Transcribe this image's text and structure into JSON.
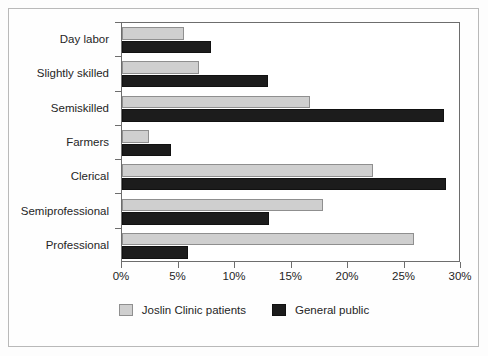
{
  "chart_data": {
    "type": "bar",
    "orientation": "horizontal",
    "title": "",
    "subtitle": "",
    "xlabel": "",
    "ylabel": "",
    "xlim": [
      0,
      30
    ],
    "ylim": null,
    "grid": false,
    "legend_position": "bottom-center",
    "xticks": [
      0,
      5,
      10,
      15,
      20,
      25,
      30
    ],
    "xtick_labels": [
      "0%",
      "5%",
      "10%",
      "15%",
      "20%",
      "25%",
      "30%"
    ],
    "categories": [
      "Day labor",
      "Slightly skilled",
      "Semiskilled",
      "Farmers",
      "Clerical",
      "Semiprofessional",
      "Professional"
    ],
    "series": [
      {
        "name": "Joslin Clinic patients",
        "color": "#cfcfcf",
        "values": [
          5.5,
          6.8,
          16.6,
          2.4,
          22.2,
          17.8,
          25.8
        ]
      },
      {
        "name": "General public",
        "color": "#1c1c1c",
        "values": [
          7.9,
          12.9,
          28.5,
          4.3,
          28.7,
          13.0,
          5.8
        ]
      }
    ]
  },
  "legend": {
    "items": [
      {
        "label": "Joslin Clinic patients",
        "swatch": "series-a"
      },
      {
        "label": "General public",
        "swatch": "series-b"
      }
    ]
  },
  "colors": {
    "series_a": "#cfcfcf",
    "series_b": "#1c1c1c",
    "axis": "#6d6d6d",
    "frame": "#b9b9b9",
    "text": "#252525"
  }
}
